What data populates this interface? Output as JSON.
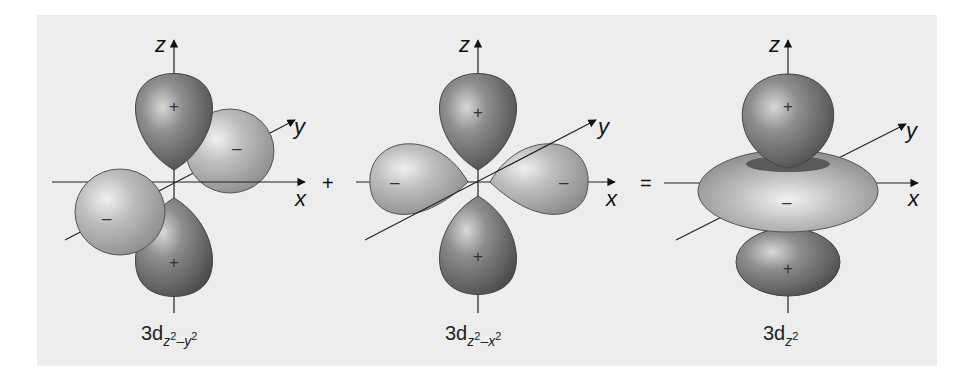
{
  "figure": {
    "background_color": "#ededed",
    "positive_lobe_color": "#7a7a7a",
    "negative_lobe_color": "#b4b4b4",
    "operators": {
      "plus": "+",
      "equals": "="
    },
    "axes": {
      "x": "x",
      "y": "y",
      "z": "z"
    },
    "signs": {
      "positive": "+",
      "negative": "–"
    },
    "panels": [
      {
        "name": "3dz2-y2",
        "caption_main": "3d",
        "caption_sub_1": "z",
        "caption_sup_1": "2",
        "caption_sub_2": "–y",
        "caption_sup_2": "2"
      },
      {
        "name": "3dz2-x2",
        "caption_main": "3d",
        "caption_sub_1": "z",
        "caption_sup_1": "2",
        "caption_sub_2": "–x",
        "caption_sup_2": "2"
      },
      {
        "name": "3dz2",
        "caption_main": "3d",
        "caption_sub_1": "z",
        "caption_sup_1": "2",
        "caption_sub_2": "",
        "caption_sup_2": ""
      }
    ]
  }
}
